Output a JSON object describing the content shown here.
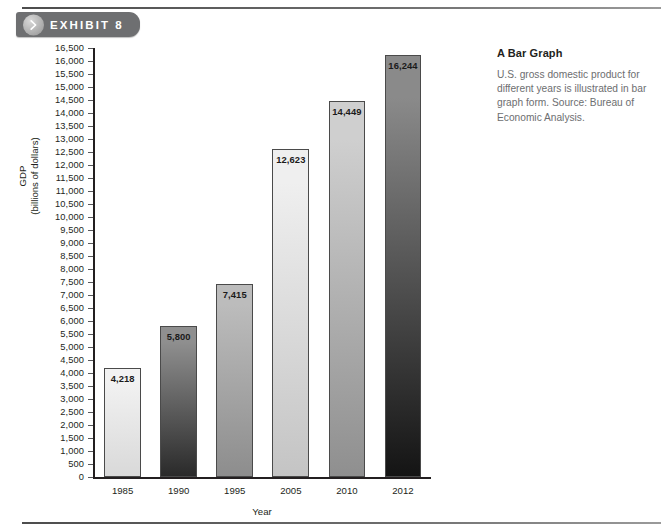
{
  "exhibit": {
    "label": "EXHIBIT 8",
    "chevron_icon": "chevron-right-icon"
  },
  "caption": {
    "title": "A Bar Graph",
    "body": "U.S. gross domestic product for different years is illustrated in bar graph form. Source: Bureau of Economic Analysis."
  },
  "chart_data": {
    "type": "bar",
    "title": "",
    "categories": [
      "1985",
      "1990",
      "1995",
      "2005",
      "2010",
      "2012"
    ],
    "values": [
      4218,
      5800,
      7415,
      12623,
      14449,
      16244
    ],
    "value_labels": [
      "4,218",
      "5,800",
      "7,415",
      "12,623",
      "14,449",
      "16,244"
    ],
    "xlabel": "Year",
    "ylabel": "GDP\n(billions of dollars)",
    "ylabel_line1": "GDP",
    "ylabel_line2": "(billions of dollars)",
    "ylim": [
      0,
      16500
    ],
    "ytick_step": 500,
    "ytick_labels": [
      "16,500",
      "16,000",
      "15,500",
      "15,000",
      "14,500",
      "14,000",
      "13,500",
      "13,000",
      "12,500",
      "12,000",
      "11,500",
      "11,000",
      "10,500",
      "10,000",
      "9,500",
      "9,000",
      "8,500",
      "8,000",
      "7,500",
      "7,000",
      "6,500",
      "6,000",
      "5,500",
      "5,000",
      "4,500",
      "4,000",
      "3,500",
      "3,000",
      "2,500",
      "2,000",
      "1,500",
      "1,000",
      "500",
      "0"
    ],
    "ytick_values": [
      16500,
      16000,
      15500,
      15000,
      14500,
      14000,
      13500,
      13000,
      12500,
      12000,
      11500,
      11000,
      10500,
      10000,
      9500,
      9000,
      8500,
      8000,
      7500,
      7000,
      6500,
      6000,
      5500,
      5000,
      4500,
      4000,
      3500,
      3000,
      2500,
      2000,
      1500,
      1000,
      500,
      0
    ],
    "grid": false,
    "legend": false,
    "bar_colors_top": [
      "#f2f2f2",
      "#8f8f8f",
      "#bcbcbc",
      "#efefef",
      "#cfcfcf",
      "#8a8a8a"
    ],
    "bar_colors_bottom": [
      "#d9d9d9",
      "#2a2a2a",
      "#8d8d8d",
      "#c4c4c4",
      "#8f8f8f",
      "#141414"
    ]
  },
  "colors": {
    "badge_bg": "#6e6f71",
    "axis": "#231f20",
    "caption_body": "#6d6e70"
  }
}
